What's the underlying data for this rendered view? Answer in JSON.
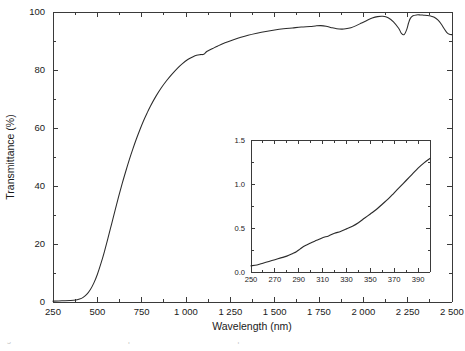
{
  "figure": {
    "background": "#ffffff",
    "line_color": "#2b2b2b",
    "axis_color": "#3a3a3a",
    "caption_partial": "Fig. 5.5 UV-VIS-NIR transmittance spectrum of a 500 nm thick sample"
  },
  "chart_data": {
    "type": "line",
    "title": "",
    "xlabel": "Wavelength (nm)",
    "ylabel": "Transmittance (%)",
    "xlim": [
      250,
      2500
    ],
    "ylim": [
      0,
      100
    ],
    "grid": false,
    "legend": null,
    "xticks": [
      250,
      500,
      750,
      1000,
      1250,
      1500,
      1750,
      2000,
      2250,
      2500
    ],
    "xticklabels": [
      "250",
      "500",
      "750",
      "1 000",
      "1 250",
      "1 500",
      "1 750",
      "2 000",
      "2 250",
      "2 500"
    ],
    "yticks": [
      0,
      20,
      40,
      60,
      80,
      100
    ],
    "yticklabels": [
      "0",
      "20",
      "40",
      "60",
      "80",
      "100"
    ],
    "xminor_step": 125,
    "yminor_step": 10,
    "series": [
      {
        "name": "transmittance",
        "x": [
          250,
          300,
          350,
          380,
          400,
          420,
          440,
          460,
          480,
          500,
          520,
          540,
          560,
          580,
          600,
          620,
          640,
          660,
          680,
          700,
          720,
          740,
          760,
          780,
          800,
          830,
          860,
          890,
          920,
          950,
          980,
          1010,
          1040,
          1060,
          1080,
          1100,
          1115,
          1130,
          1150,
          1180,
          1220,
          1260,
          1300,
          1350,
          1400,
          1450,
          1500,
          1550,
          1600,
          1650,
          1700,
          1730,
          1760,
          1790,
          1820,
          1850,
          1880,
          1900,
          1930,
          1960,
          1990,
          2020,
          2050,
          2080,
          2110,
          2140,
          2170,
          2200,
          2215,
          2230,
          2245,
          2255,
          2265,
          2280,
          2300,
          2320,
          2340,
          2360,
          2380,
          2400,
          2420,
          2440,
          2455,
          2470,
          2485,
          2500
        ],
        "y": [
          0.3,
          0.4,
          0.5,
          0.7,
          1.0,
          1.6,
          2.6,
          4.2,
          6.5,
          9.5,
          13.2,
          17.4,
          22.0,
          26.8,
          31.6,
          36.3,
          40.8,
          45.0,
          49.0,
          52.7,
          56.2,
          59.4,
          62.4,
          65.1,
          67.6,
          70.9,
          73.8,
          76.3,
          78.5,
          80.5,
          82.2,
          83.6,
          84.6,
          85.1,
          85.3,
          85.4,
          86.3,
          86.8,
          87.4,
          88.3,
          89.4,
          90.3,
          91.1,
          92.0,
          92.7,
          93.3,
          93.8,
          94.2,
          94.5,
          94.8,
          95.0,
          95.2,
          95.3,
          95.1,
          94.6,
          94.2,
          94.1,
          94.2,
          94.6,
          95.3,
          96.2,
          97.1,
          97.9,
          98.4,
          98.5,
          98.0,
          96.6,
          94.3,
          92.6,
          92.2,
          94.0,
          96.2,
          97.8,
          98.7,
          99.0,
          99.0,
          98.9,
          98.8,
          98.6,
          98.2,
          97.3,
          95.8,
          94.3,
          93.0,
          92.3,
          92.2
        ]
      }
    ],
    "inset": {
      "type": "line",
      "xlabel": "",
      "ylabel": "",
      "xlim": [
        250,
        400
      ],
      "ylim": [
        0.0,
        1.5
      ],
      "xticks": [
        250,
        270,
        290,
        310,
        330,
        350,
        370,
        390
      ],
      "xticklabels": [
        "250",
        "270",
        "290",
        "310",
        "330",
        "350",
        "370",
        "390"
      ],
      "yticks": [
        0.0,
        0.5,
        1.0,
        1.5
      ],
      "yticklabels": [
        "0.0",
        "0.5",
        "1.0",
        "1.5"
      ],
      "xminor_step": 10,
      "yminor_step": 0.25,
      "series": [
        {
          "name": "inset-transmittance",
          "x": [
            250,
            255,
            260,
            265,
            270,
            275,
            280,
            285,
            288,
            291,
            294,
            297,
            300,
            305,
            310,
            315,
            320,
            325,
            330,
            335,
            340,
            345,
            350,
            355,
            360,
            365,
            370,
            375,
            380,
            385,
            390,
            395,
            400
          ],
          "y": [
            0.07,
            0.08,
            0.1,
            0.12,
            0.14,
            0.16,
            0.18,
            0.21,
            0.23,
            0.26,
            0.29,
            0.31,
            0.33,
            0.36,
            0.39,
            0.41,
            0.44,
            0.46,
            0.49,
            0.52,
            0.56,
            0.61,
            0.66,
            0.71,
            0.77,
            0.83,
            0.9,
            0.97,
            1.04,
            1.11,
            1.18,
            1.24,
            1.29
          ]
        }
      ]
    }
  }
}
